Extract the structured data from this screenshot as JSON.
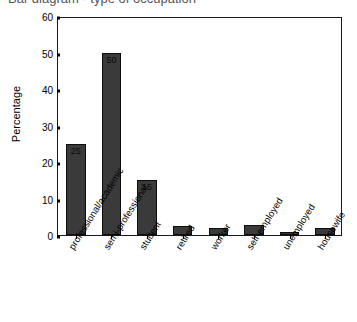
{
  "chart": {
    "title_clipped": "Bar diagram - type of occupation",
    "ylabel": "Percentage"
  },
  "chart_data": {
    "type": "bar",
    "title": "Bar diagram - type of occupation",
    "xlabel": "",
    "ylabel": "Percentage",
    "ylim": [
      0,
      60
    ],
    "yticks": [
      0,
      10,
      20,
      30,
      40,
      50,
      60
    ],
    "grid": false,
    "legend": null,
    "bar_color": "#3a3a3a",
    "bar_edge_color": "#0d0d0d",
    "categories": [
      "professional/academic",
      "semi-professional",
      "student",
      "retired",
      "worker",
      "self-employed",
      "unemployed",
      "housewife"
    ],
    "values": [
      25,
      50,
      15,
      2.5,
      1.8,
      2.8,
      0.7,
      1.8
    ],
    "data_labels": [
      "25",
      "50",
      "15",
      "",
      "",
      "",
      "",
      ""
    ],
    "annotations": []
  }
}
